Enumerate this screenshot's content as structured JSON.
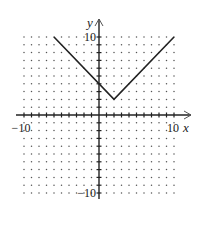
{
  "chart_data": {
    "type": "line",
    "title": "",
    "xlabel": "x",
    "ylabel": "y",
    "xlim": [
      -10,
      10
    ],
    "ylim": [
      -10,
      10
    ],
    "grid": "dots",
    "grid_step": 1,
    "tick_step": 1,
    "tick_labels": {
      "x_min": "−10",
      "x_max": "10",
      "y_min": "−10",
      "y_max": "10"
    },
    "series": [
      {
        "name": "y = |x − 2| + 2",
        "points": [
          [
            -6,
            10
          ],
          [
            2,
            2
          ],
          [
            10,
            10
          ]
        ]
      }
    ],
    "colors": {
      "line": "#222222",
      "axis": "#222222",
      "grid": "#555555"
    }
  }
}
